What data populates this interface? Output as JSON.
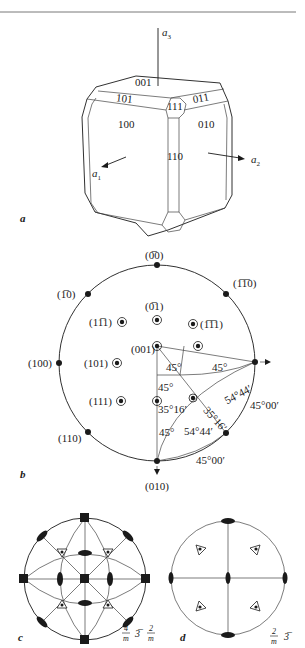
{
  "figure_a": {
    "tag": "a",
    "axes": {
      "a1": "a",
      "a1_sub": "1",
      "a2": "a",
      "a2_sub": "2",
      "a3": "a",
      "a3_sub": "3"
    },
    "faces": [
      "001",
      "101",
      "111",
      "011",
      "100",
      "010",
      "110"
    ],
    "face_bars": {
      "101": "0",
      "111": "1",
      "011": "1"
    }
  },
  "figure_b": {
    "tag": "b",
    "poles": {
      "p0m10": "(0̅0)",
      "p1m10": "(1̅0)",
      "pm1m10": "(1̅1̅0)",
      "p0m11": "(0̅1)",
      "p1m11": "(11̅1)",
      "pm1m11": "(1̅1̅1)",
      "p100": "(100)",
      "p101": "(101)",
      "p001": "(001)",
      "p111": "(111)",
      "p110": "(110)",
      "p010": "(010)"
    },
    "angles": {
      "a1": "45°",
      "a2": "45°",
      "a3": "45°",
      "a4": "35°16′",
      "a5": "54°44′",
      "a6": "35°16′",
      "a7": "45°",
      "a8": "54°44′",
      "a9": "45°00′",
      "a10": "45°00′"
    }
  },
  "figure_c": {
    "tag": "c",
    "symbol": {
      "n1": "4",
      "d1": "m",
      "mid": "3̅",
      "n2": "2",
      "d2": "m"
    }
  },
  "figure_d": {
    "tag": "d",
    "symbol": {
      "n1": "2",
      "d1": "m",
      "mid": "3̅"
    }
  }
}
